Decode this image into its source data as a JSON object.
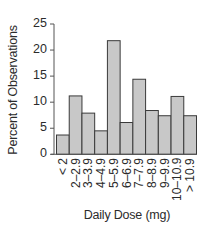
{
  "chart_data": {
    "type": "bar",
    "title": "",
    "xlabel": "Daily Dose (mg)",
    "ylabel": "Percent of Observations",
    "ylim": [
      0,
      25
    ],
    "yticks": [
      0,
      5,
      10,
      15,
      20,
      25
    ],
    "grid": false,
    "legend": null,
    "categories": [
      "< 2",
      "2–2.9",
      "3–3.9",
      "4–4.9",
      "5–5.9",
      "6–6.9",
      "7–7.9",
      "8–8.9",
      "9–9.9",
      "10–10.9",
      "> 10.9"
    ],
    "values": [
      3.7,
      11.2,
      7.9,
      4.5,
      21.8,
      6.1,
      14.4,
      8.4,
      7.4,
      11.1,
      7.4
    ],
    "colors": {
      "bar_fill": "#c8c8c8",
      "bar_edge": "#3a3a3a",
      "axis": "#555555"
    }
  }
}
